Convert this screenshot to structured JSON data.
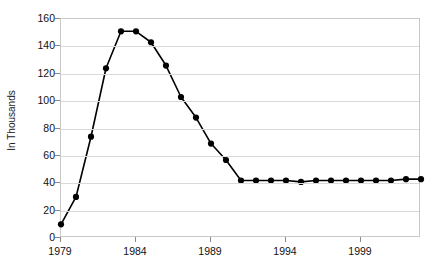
{
  "chart": {
    "title": "",
    "y_axis_title": "In Thousands",
    "marker_color": "#000000",
    "line_color": "#000000",
    "gridline_color": "#d9d9d9",
    "plot_border_color": "#c8c8c8",
    "background_color": "#ffffff"
  },
  "chart_data": {
    "type": "line",
    "title": "",
    "xlabel": "",
    "ylabel": "In Thousands",
    "xlim": [
      1979,
      2003
    ],
    "ylim": [
      0,
      160
    ],
    "ytick_labels": [
      "0",
      "20",
      "40",
      "60",
      "80",
      "100",
      "120",
      "140",
      "160"
    ],
    "ytick_values": [
      0,
      20,
      40,
      60,
      80,
      100,
      120,
      140,
      160
    ],
    "xtick_labels": [
      "1979",
      "1984",
      "1989",
      "1994",
      "1999"
    ],
    "xtick_values": [
      1979,
      1984,
      1989,
      1994,
      1999
    ],
    "grid": "horizontal",
    "legend": "none",
    "markers": "filled-circle",
    "x": [
      1979,
      1980,
      1981,
      1982,
      1983,
      1984,
      1985,
      1986,
      1987,
      1988,
      1989,
      1990,
      1991,
      1992,
      1993,
      1994,
      1995,
      1996,
      1997,
      1998,
      1999,
      2000,
      2001,
      2002,
      2003
    ],
    "values": [
      10,
      30,
      74,
      124,
      151,
      151,
      143,
      126,
      103,
      88,
      69,
      57,
      42,
      42,
      42,
      42,
      41,
      42,
      42,
      42,
      42,
      42,
      42,
      43,
      43
    ],
    "series": [
      {
        "name": "series-1",
        "values": [
          10,
          30,
          74,
          124,
          151,
          151,
          143,
          126,
          103,
          88,
          69,
          57,
          42,
          42,
          42,
          42,
          41,
          42,
          42,
          42,
          42,
          42,
          42,
          43,
          43
        ]
      }
    ]
  }
}
